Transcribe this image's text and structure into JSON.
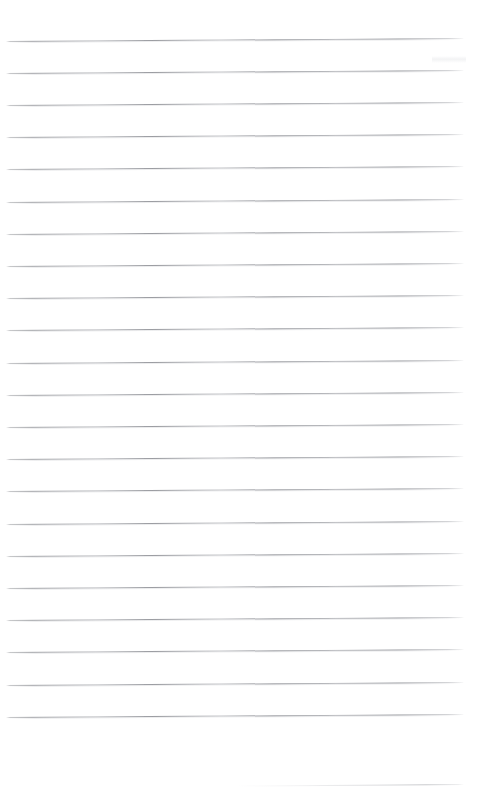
{
  "document": {
    "kind": "scanned-ruled-notebook-page",
    "title": "Blank ruled notebook page",
    "page_width": 486,
    "page_height": 793,
    "background_color": "#ffffff",
    "rule_color": "#8b8d93",
    "text_content": "",
    "handwriting_present": "none",
    "margin_rule_present": "none",
    "hole_punches_present": "none"
  },
  "ruling": {
    "line_count": 23,
    "spacing_px": 32.2,
    "first_line_y": 41,
    "line_left_x": 6,
    "line_right_x": 464,
    "line_thickness_px": 1,
    "skew_degrees": -0.375,
    "skew_note": "right end sits about 3 px higher than left end",
    "lines": [
      {
        "index": 1,
        "y": 41.0,
        "faint": false
      },
      {
        "index": 2,
        "y": 73.2,
        "faint": false
      },
      {
        "index": 3,
        "y": 105.4,
        "faint": false
      },
      {
        "index": 4,
        "y": 137.6,
        "faint": false
      },
      {
        "index": 5,
        "y": 169.8,
        "faint": false
      },
      {
        "index": 6,
        "y": 202.0,
        "faint": false
      },
      {
        "index": 7,
        "y": 234.2,
        "faint": false
      },
      {
        "index": 8,
        "y": 266.4,
        "faint": false
      },
      {
        "index": 9,
        "y": 298.6,
        "faint": false
      },
      {
        "index": 10,
        "y": 330.8,
        "faint": false
      },
      {
        "index": 11,
        "y": 363.0,
        "faint": false
      },
      {
        "index": 12,
        "y": 395.2,
        "faint": false
      },
      {
        "index": 13,
        "y": 427.4,
        "faint": false
      },
      {
        "index": 14,
        "y": 459.6,
        "faint": false
      },
      {
        "index": 15,
        "y": 491.8,
        "faint": false
      },
      {
        "index": 16,
        "y": 524.0,
        "faint": false
      },
      {
        "index": 17,
        "y": 556.2,
        "faint": false
      },
      {
        "index": 18,
        "y": 588.4,
        "faint": false
      },
      {
        "index": 19,
        "y": 620.6,
        "faint": false
      },
      {
        "index": 20,
        "y": 652.8,
        "faint": false
      },
      {
        "index": 21,
        "y": 685.0,
        "faint": false
      },
      {
        "index": 22,
        "y": 717.2,
        "faint": false
      },
      {
        "index": 23,
        "y": 787.0,
        "faint": true
      }
    ]
  }
}
